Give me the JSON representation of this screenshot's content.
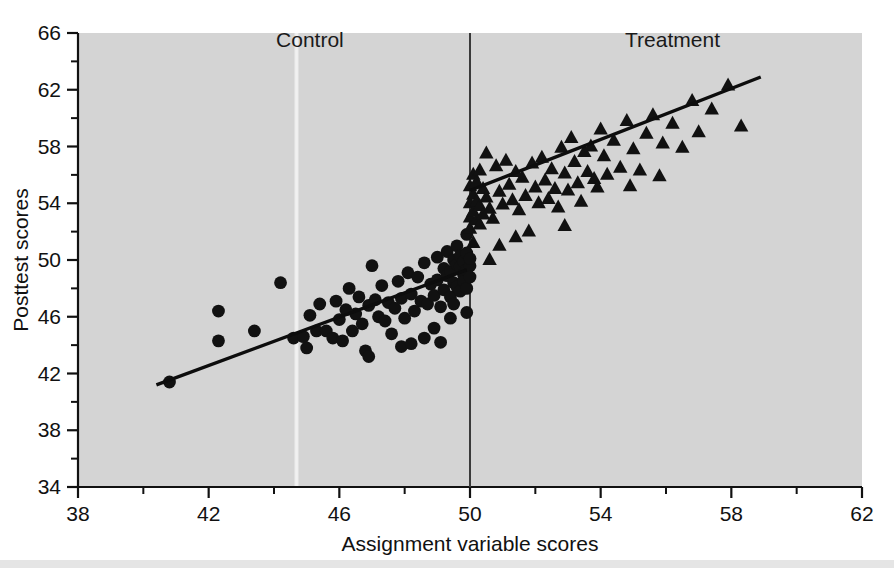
{
  "chart_data": {
    "type": "scatter",
    "title": "",
    "xlabel": "Assignment variable scores",
    "ylabel": "Posttest scores",
    "xlim": [
      38,
      62
    ],
    "ylim": [
      34,
      66
    ],
    "xticks": [
      38,
      42,
      46,
      50,
      54,
      58,
      62
    ],
    "xtick_labels": [
      "38",
      "42",
      "46",
      "50",
      "54",
      "58",
      "62"
    ],
    "yticks": [
      34,
      38,
      42,
      46,
      50,
      54,
      58,
      62,
      66
    ],
    "ytick_labels": [
      "34",
      "38",
      "42",
      "46",
      "50",
      "54",
      "58",
      "62",
      "66"
    ],
    "x_minor_step": 2,
    "y_minor_step": 2,
    "grid": false,
    "legend_position": "none",
    "cutoff": {
      "value": 50,
      "label": "assignment-variable-cutoff",
      "orientation": "vertical"
    },
    "annotations": [
      {
        "text": "Control",
        "x": 45.1,
        "y": 65.0
      },
      {
        "text": "Treatment",
        "x": 56.2,
        "y": 65.0
      }
    ],
    "series": [
      {
        "name": "Control",
        "marker": "circle",
        "color": "#111111",
        "fit_line": {
          "x": [
            40.4,
            49.9
          ],
          "y": [
            41.2,
            49.3
          ]
        },
        "points": [
          [
            40.8,
            41.4
          ],
          [
            42.3,
            46.4
          ],
          [
            42.3,
            44.3
          ],
          [
            43.4,
            45.0
          ],
          [
            44.2,
            48.4
          ],
          [
            44.6,
            44.5
          ],
          [
            44.9,
            44.6
          ],
          [
            45.1,
            46.1
          ],
          [
            45.3,
            45.0
          ],
          [
            45.4,
            46.9
          ],
          [
            45.6,
            45.0
          ],
          [
            45.8,
            44.5
          ],
          [
            45.9,
            47.1
          ],
          [
            46.0,
            45.8
          ],
          [
            46.1,
            44.3
          ],
          [
            46.2,
            46.5
          ],
          [
            46.3,
            48.0
          ],
          [
            46.4,
            45.0
          ],
          [
            46.5,
            46.2
          ],
          [
            46.6,
            47.4
          ],
          [
            46.7,
            45.5
          ],
          [
            46.8,
            43.6
          ],
          [
            46.9,
            46.8
          ],
          [
            47.0,
            49.6
          ],
          [
            47.1,
            47.2
          ],
          [
            47.2,
            46.0
          ],
          [
            47.3,
            48.2
          ],
          [
            47.4,
            45.7
          ],
          [
            47.5,
            47.0
          ],
          [
            47.6,
            44.8
          ],
          [
            47.7,
            46.6
          ],
          [
            47.8,
            48.5
          ],
          [
            47.9,
            47.3
          ],
          [
            48.0,
            45.9
          ],
          [
            48.1,
            49.1
          ],
          [
            48.2,
            47.6
          ],
          [
            48.3,
            46.4
          ],
          [
            48.4,
            48.8
          ],
          [
            48.5,
            47.1
          ],
          [
            48.6,
            49.8
          ],
          [
            48.7,
            46.9
          ],
          [
            48.8,
            48.3
          ],
          [
            48.9,
            47.5
          ],
          [
            49.0,
            50.2
          ],
          [
            49.0,
            48.6
          ],
          [
            49.1,
            46.7
          ],
          [
            49.2,
            49.4
          ],
          [
            49.2,
            47.9
          ],
          [
            49.3,
            48.9
          ],
          [
            49.3,
            50.6
          ],
          [
            49.4,
            47.4
          ],
          [
            49.4,
            49.2
          ],
          [
            49.5,
            48.4
          ],
          [
            49.5,
            50.0
          ],
          [
            49.5,
            46.9
          ],
          [
            49.6,
            49.7
          ],
          [
            49.6,
            48.1
          ],
          [
            49.6,
            51.0
          ],
          [
            49.7,
            49.5
          ],
          [
            49.7,
            47.8
          ],
          [
            49.7,
            50.3
          ],
          [
            49.8,
            49.0
          ],
          [
            49.8,
            48.5
          ],
          [
            49.8,
            49.9
          ],
          [
            49.9,
            49.3
          ],
          [
            49.9,
            50.5
          ],
          [
            49.9,
            48.0
          ],
          [
            49.9,
            46.3
          ],
          [
            49.9,
            51.8
          ],
          [
            50.0,
            49.6
          ],
          [
            50.0,
            48.8
          ],
          [
            50.0,
            50.1
          ],
          [
            49.4,
            45.9
          ],
          [
            48.6,
            44.5
          ],
          [
            48.9,
            45.2
          ],
          [
            47.9,
            43.9
          ],
          [
            45.0,
            43.8
          ],
          [
            46.9,
            43.2
          ],
          [
            48.2,
            44.1
          ],
          [
            49.1,
            44.2
          ]
        ]
      },
      {
        "name": "Treatment",
        "marker": "triangle",
        "color": "#111111",
        "fit_line": {
          "x": [
            50.0,
            58.9
          ],
          "y": [
            54.9,
            62.9
          ]
        },
        "points": [
          [
            50.0,
            55.2
          ],
          [
            50.0,
            54.0
          ],
          [
            50.0,
            53.0
          ],
          [
            50.0,
            52.2
          ],
          [
            50.1,
            56.0
          ],
          [
            50.1,
            54.6
          ],
          [
            50.1,
            53.4
          ],
          [
            50.1,
            51.2
          ],
          [
            50.2,
            55.5
          ],
          [
            50.2,
            54.1
          ],
          [
            50.2,
            52.8
          ],
          [
            50.3,
            56.3
          ],
          [
            50.3,
            53.8
          ],
          [
            50.3,
            52.5
          ],
          [
            50.4,
            55.0
          ],
          [
            50.4,
            53.2
          ],
          [
            50.5,
            57.5
          ],
          [
            50.5,
            54.4
          ],
          [
            50.6,
            53.6
          ],
          [
            50.7,
            52.9
          ],
          [
            50.8,
            56.6
          ],
          [
            50.9,
            54.8
          ],
          [
            51.0,
            53.9
          ],
          [
            51.1,
            57.0
          ],
          [
            51.2,
            55.3
          ],
          [
            51.3,
            54.2
          ],
          [
            51.4,
            56.2
          ],
          [
            51.5,
            53.5
          ],
          [
            51.6,
            55.8
          ],
          [
            51.7,
            54.5
          ],
          [
            51.8,
            52.0
          ],
          [
            51.9,
            56.8
          ],
          [
            52.0,
            55.1
          ],
          [
            52.1,
            54.0
          ],
          [
            52.2,
            57.2
          ],
          [
            52.3,
            55.6
          ],
          [
            52.4,
            54.3
          ],
          [
            52.5,
            56.4
          ],
          [
            52.6,
            55.0
          ],
          [
            52.7,
            53.7
          ],
          [
            52.8,
            57.9
          ],
          [
            52.9,
            56.1
          ],
          [
            53.0,
            54.9
          ],
          [
            53.1,
            58.6
          ],
          [
            53.2,
            56.9
          ],
          [
            53.3,
            55.4
          ],
          [
            53.4,
            54.1
          ],
          [
            53.5,
            57.6
          ],
          [
            53.6,
            56.2
          ],
          [
            53.7,
            58.0
          ],
          [
            53.8,
            55.7
          ],
          [
            54.0,
            59.2
          ],
          [
            54.1,
            57.3
          ],
          [
            54.2,
            56.0
          ],
          [
            54.4,
            58.4
          ],
          [
            54.6,
            56.5
          ],
          [
            54.8,
            59.8
          ],
          [
            55.0,
            57.8
          ],
          [
            55.2,
            56.3
          ],
          [
            55.4,
            58.9
          ],
          [
            55.6,
            60.2
          ],
          [
            55.9,
            58.2
          ],
          [
            56.2,
            59.6
          ],
          [
            56.5,
            57.9
          ],
          [
            56.8,
            61.2
          ],
          [
            57.0,
            59.0
          ],
          [
            57.4,
            60.6
          ],
          [
            57.9,
            62.3
          ],
          [
            58.3,
            59.4
          ],
          [
            55.8,
            55.9
          ],
          [
            54.9,
            55.2
          ],
          [
            53.9,
            55.1
          ],
          [
            52.9,
            52.4
          ],
          [
            51.4,
            51.6
          ],
          [
            50.9,
            51.0
          ],
          [
            50.6,
            50.0
          ]
        ]
      }
    ]
  },
  "figure": {
    "panel_background": "#d4d4d4",
    "page_background": "#ffffff",
    "marker_color": "#111111",
    "line_color": "#0d0d0d"
  }
}
